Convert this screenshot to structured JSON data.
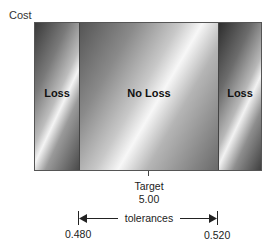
{
  "diagram": {
    "y_axis_label": "Cost",
    "regions": [
      {
        "label": "Loss",
        "position": "left"
      },
      {
        "label": "No Loss",
        "position": "center"
      },
      {
        "label": "Loss",
        "position": "right"
      }
    ],
    "target": {
      "label": "Target",
      "value": "5.00"
    },
    "tolerance": {
      "label": "tolerances",
      "lower": "0.480",
      "upper": "0.520"
    }
  }
}
